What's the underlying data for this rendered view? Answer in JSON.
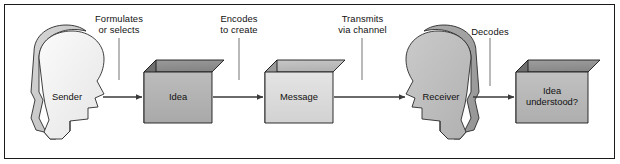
{
  "figure": {
    "border_color": "#1a1a1a",
    "background": "#ffffff"
  },
  "palette": {
    "sender_head_fill": "#f2f2f2",
    "sender_head_shadow": "#c9c9c9",
    "receiver_head_fill": "#bdbdbd",
    "receiver_head_shadow": "#9d9d9d",
    "idea_front": "#b3b3b3",
    "idea_top": "#8f8f8f",
    "idea_side": "#6f6f6f",
    "message_front": "#dcdcdc",
    "message_top": "#bdbdbd",
    "message_side": "#9a9a9a",
    "understood_front": "#b8b8b8",
    "understood_top": "#949494",
    "understood_side": "#6f6f6f",
    "outline": "#1a1a1a",
    "arrow": "#3a3a3a",
    "leader": "#8a8a8a",
    "text": "#111111"
  },
  "nodes": [
    {
      "id": "sender",
      "kind": "head",
      "label": "Sender",
      "facing": "right"
    },
    {
      "id": "idea",
      "kind": "box",
      "label": "Idea"
    },
    {
      "id": "message",
      "kind": "box",
      "label": "Message"
    },
    {
      "id": "receiver",
      "kind": "head",
      "label": "Receiver",
      "facing": "left"
    },
    {
      "id": "understood",
      "kind": "box",
      "label": "Idea\nunderstood?"
    }
  ],
  "step_labels": [
    {
      "id": "formulates",
      "text": "Formulates\nor selects"
    },
    {
      "id": "encodes",
      "text": "Encodes\nto create"
    },
    {
      "id": "transmits",
      "text": "Transmits\nvia channel"
    },
    {
      "id": "decodes",
      "text": "Decodes"
    }
  ],
  "connectors": [
    {
      "from": "sender",
      "to": "idea"
    },
    {
      "from": "idea",
      "to": "message"
    },
    {
      "from": "message",
      "to": "receiver"
    },
    {
      "from": "receiver",
      "to": "understood"
    }
  ]
}
